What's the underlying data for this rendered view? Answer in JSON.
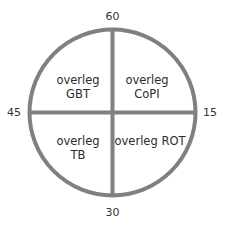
{
  "diagram": {
    "title": "",
    "line_color": "#808080",
    "clock_labels": {
      "top": "60",
      "right": "15",
      "bottom": "30",
      "left": "45"
    },
    "quadrants": {
      "top_left": {
        "line1": "overleg",
        "line2": "GBT"
      },
      "top_right": {
        "line1": "overleg",
        "line2": "CoPI"
      },
      "bottom_left": {
        "line1": "overleg",
        "line2": "TB"
      },
      "bottom_right": {
        "line1": "overleg ROT",
        "line2": ""
      }
    }
  }
}
